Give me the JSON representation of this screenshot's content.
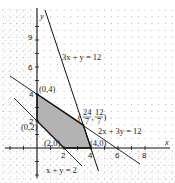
{
  "figure": {
    "type": "linear-programming-feasible-region",
    "axes": {
      "x_label": "x",
      "y_label": "y",
      "x_ticks": [
        "2",
        "4",
        "6",
        "8"
      ],
      "y_ticks": [
        "2",
        "4",
        "6",
        "9"
      ]
    },
    "lines": [
      {
        "equation": "3x + y = 12",
        "label": "3x + y = 12"
      },
      {
        "equation": "2x + 3y = 12",
        "label": "2x + 3y = 12"
      },
      {
        "equation": "x + y = 2",
        "label": "x + y = 2"
      }
    ],
    "vertices": [
      {
        "label": "(0,4)",
        "x": 0,
        "y": 4
      },
      {
        "label": "(0,2)",
        "x": 0,
        "y": 2
      },
      {
        "label": "(2,0)",
        "x": 2,
        "y": 0
      },
      {
        "label": "(4,0)",
        "x": 4,
        "y": 0
      },
      {
        "label": "(24/7, 12/7)",
        "x": 3.43,
        "y": 1.71,
        "num_x": "24",
        "den_x": "7",
        "num_y": "12",
        "den_y": "7"
      }
    ],
    "feasible_region_color": "#b3b3b3",
    "line_color": "#222222",
    "dot_color": "#9a9a9a"
  }
}
